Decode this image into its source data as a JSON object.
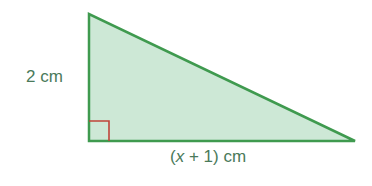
{
  "diagram": {
    "type": "right-triangle",
    "colors": {
      "fill": "#cde8d6",
      "stroke": "#3f9a4f",
      "right_angle_marker": "#c0443a",
      "label": "#4a7a5a"
    },
    "vertices": {
      "top": [
        89,
        14
      ],
      "bottom_left": [
        89,
        141
      ],
      "bottom_right": [
        355,
        141
      ]
    },
    "labels": {
      "height": "2 cm",
      "base_prefix": "(",
      "base_var": "x",
      "base_suffix": " + 1) cm"
    }
  }
}
